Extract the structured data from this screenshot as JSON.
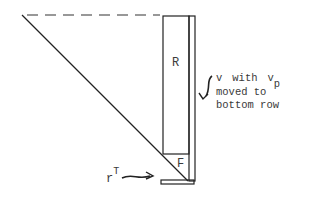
{
  "diagram": {
    "labels": {
      "R": "R",
      "F": "F",
      "r": "r",
      "r_sup": "T",
      "note_line1_v": "v",
      "note_line1_with": "with",
      "note_line1_vp": "v",
      "note_line1_vp_sub": "p",
      "note_line2": "moved to",
      "note_line3": "bottom row"
    },
    "colors": {
      "stroke": "#222222",
      "text": "#3a3a3a",
      "background": "#ffffff"
    }
  }
}
